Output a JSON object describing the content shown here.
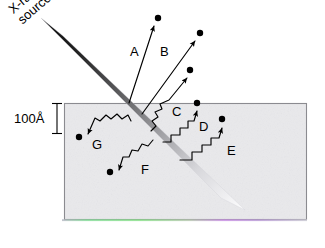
{
  "figure": {
    "type": "schematic-diagram",
    "title_text": "",
    "source_label": {
      "line1": "X-ray",
      "line2": "source"
    },
    "scale_bar": {
      "label": "100Å",
      "value": 100,
      "unit": "Å"
    },
    "colors": {
      "background": "#ffffff",
      "material_fill": "#e9e9ec",
      "material_edge": "#8b8b90",
      "beam_dark": "#1a1a1a",
      "beam_light": "#fbfbfc",
      "ink": "#000000",
      "fringe_green": "#7fdc7f",
      "fringe_magenta": "#cf8fe0"
    },
    "material": {
      "x": 64,
      "y": 103,
      "width": 243,
      "height": 117
    },
    "beam": {
      "entry_x": 131,
      "entry_y": 103,
      "start_x": 52,
      "start_y": 27,
      "end_x": 233,
      "end_y": 204,
      "note": "tapered band, dark at source fading to white inside material"
    },
    "tracks": [
      {
        "id": "A",
        "label": "A",
        "kind": "escaping-electron",
        "label_x": 130,
        "label_y": 45,
        "dot_x": 158,
        "dot_y": 18,
        "tip_x": 154,
        "tip_y": 26,
        "tail_x": 129,
        "tail_y": 103
      },
      {
        "id": "B",
        "label": "B",
        "kind": "escaping-electron",
        "label_x": 160,
        "label_y": 45,
        "dot_x": 200,
        "dot_y": 33,
        "tip_x": 195,
        "tip_y": 41,
        "tail_x": 142,
        "tail_y": 114
      },
      {
        "id": "C",
        "label": "C",
        "kind": "escaping-electron",
        "label_x": 172,
        "label_y": 105,
        "dot_x": 190,
        "dot_y": 70,
        "tip_x": 187,
        "tip_y": 78,
        "tail_x": 151,
        "tail_y": 131
      },
      {
        "id": "D",
        "label": "D",
        "kind": "escaping-electron",
        "label_x": 199,
        "label_y": 120,
        "dot_x": 197,
        "dot_y": 103,
        "tip_x": 197,
        "tip_y": 111,
        "tail_x": 163,
        "tail_y": 142
      },
      {
        "id": "E",
        "label": "E",
        "kind": "escaping-electron",
        "label_x": 227,
        "label_y": 144,
        "dot_x": 222,
        "dot_y": 119,
        "tip_x": 222,
        "tip_y": 128,
        "tail_x": 180,
        "tail_y": 160
      },
      {
        "id": "F",
        "label": "F",
        "kind": "absorbed-electron",
        "label_x": 141,
        "label_y": 163,
        "dot_x": 110,
        "dot_y": 172,
        "tip_x": 119,
        "tip_y": 170,
        "tail_x": 153,
        "tail_y": 140
      },
      {
        "id": "G",
        "label": "G",
        "kind": "absorbed-electron",
        "label_x": 92,
        "label_y": 138,
        "dot_x": 79,
        "dot_y": 137,
        "tip_x": 88,
        "tip_y": 134,
        "tail_x": 131,
        "tail_y": 121
      }
    ],
    "track_count": 7
  }
}
